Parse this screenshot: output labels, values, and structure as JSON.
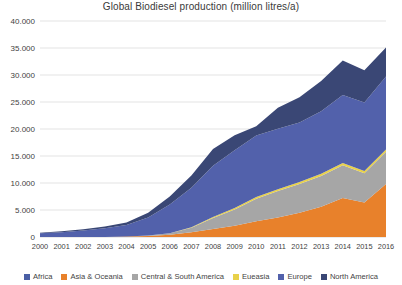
{
  "chart_data": {
    "type": "area",
    "stacked": true,
    "title": "Global Biodiesel production (million litres/a)",
    "xlabel": "",
    "ylabel": "",
    "grid": true,
    "legend_position": "bottom",
    "ylim": [
      0,
      40000
    ],
    "ytick_labels": [
      "0",
      "5.000",
      "10.000",
      "15.000",
      "20.000",
      "25.000",
      "30.000",
      "35.000",
      "40.000"
    ],
    "ytick_values": [
      0,
      5000,
      10000,
      15000,
      20000,
      25000,
      30000,
      35000,
      40000
    ],
    "categories": [
      "2000",
      "2001",
      "2002",
      "2003",
      "2004",
      "2005",
      "2006",
      "2007",
      "2008",
      "2009",
      "2010",
      "2011",
      "2012",
      "2013",
      "2014",
      "2015",
      "2016"
    ],
    "series": [
      {
        "name": "Africa",
        "color": "#4a5fa5",
        "values": [
          0,
          0,
          0,
          0,
          0,
          0,
          0,
          0,
          0,
          0,
          0,
          0,
          0,
          0,
          0,
          0,
          0
        ]
      },
      {
        "name": "Asia & Oceania",
        "color": "#e8812b",
        "values": [
          0,
          0,
          0,
          0,
          100,
          200,
          400,
          900,
          1500,
          2100,
          2900,
          3600,
          4500,
          5600,
          7200,
          6400,
          9800
        ]
      },
      {
        "name": "Central & South America",
        "color": "#a6a6a6",
        "values": [
          0,
          0,
          0,
          0,
          0,
          100,
          300,
          800,
          2000,
          3000,
          4200,
          4900,
          5300,
          5700,
          6100,
          5400,
          6000
        ]
      },
      {
        "name": "Eueasia",
        "color": "#e8d14a",
        "values": [
          0,
          0,
          0,
          0,
          0,
          0,
          0,
          100,
          200,
          250,
          300,
          350,
          400,
          400,
          400,
          400,
          400
        ]
      },
      {
        "name": "Europe",
        "color": "#5261ab",
        "values": [
          700,
          900,
          1200,
          1600,
          2100,
          3300,
          5300,
          7300,
          9500,
          10700,
          11400,
          11200,
          11000,
          11600,
          12600,
          12700,
          13500
        ]
      },
      {
        "name": "North America",
        "color": "#3a4775",
        "values": [
          100,
          150,
          250,
          350,
          500,
          900,
          1500,
          2300,
          3100,
          2800,
          1700,
          3900,
          4700,
          5600,
          6400,
          6000,
          5400
        ]
      }
    ]
  }
}
